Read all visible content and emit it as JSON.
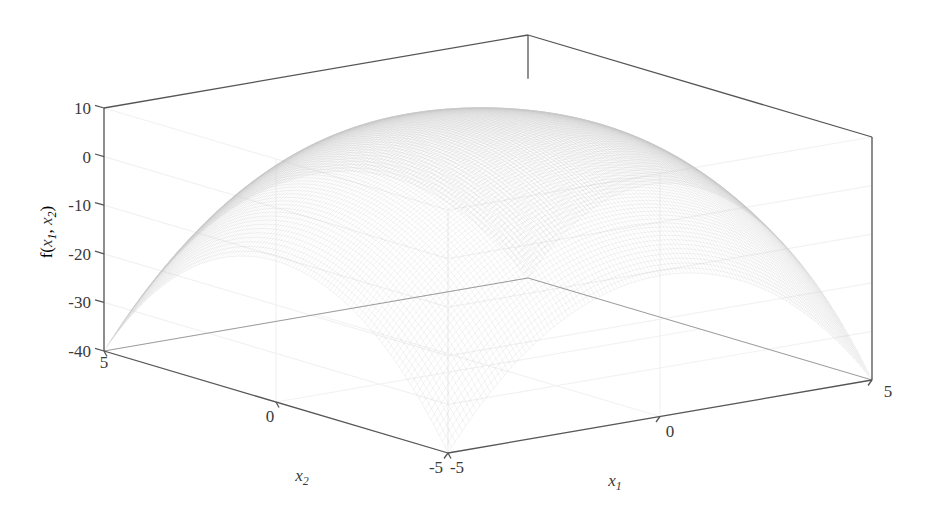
{
  "figure": {
    "type": "surface-plot-3d",
    "background_color": "#ffffff",
    "axis_line_color": "#555555",
    "grid_color": "#f2f2f2",
    "mesh_color": "#c8c8c8",
    "text_color": "#3a3a3a"
  },
  "chart_data": {
    "type": "surface",
    "title": "",
    "xlabel": "x_1",
    "ylabel": "x_2",
    "zlabel": "f(x_1, x_2)",
    "xlabel_display": "x",
    "xlabel_sub": "1",
    "ylabel_display": "x",
    "ylabel_sub": "2",
    "zlabel_prefix": "f(",
    "zlabel_x1": "x",
    "zlabel_x1_sub": "1",
    "zlabel_sep": ", ",
    "zlabel_x2": "x",
    "zlabel_x2_sub": "2",
    "zlabel_suffix": ")",
    "xlim": [
      -5,
      5
    ],
    "ylim": [
      -5,
      5
    ],
    "zlim": [
      -40,
      10
    ],
    "xticks": [
      -5,
      0,
      5
    ],
    "xtick_labels": [
      "-5",
      "0",
      "5"
    ],
    "yticks": [
      -5,
      0,
      5
    ],
    "ytick_labels": [
      "-5",
      "0",
      "5"
    ],
    "zticks": [
      -40,
      -30,
      -20,
      -10,
      0,
      10
    ],
    "ztick_labels": [
      "-40",
      "-30",
      "-20",
      "-10",
      "0",
      "10"
    ],
    "grid": true,
    "legend": false,
    "surface_style": "fine mesh wireframe, very light gray, no face shading",
    "peak_value": 10,
    "peak_x": 0,
    "peak_y": 0,
    "corner_value": -40,
    "view_azimuth_deg": -37.5,
    "view_elevation_deg": 30,
    "mesh_resolution": 120
  },
  "axes_box": {
    "origin_corner_px": [
      104,
      351
    ],
    "front_corner_px": [
      448,
      453
    ],
    "right_corner_px": [
      872,
      380
    ],
    "back_corner_px": [
      548,
      285
    ],
    "z_top_px": 108,
    "z_bottom_px": 351
  },
  "tick_texts": {
    "z": [
      "10",
      "0",
      "-10",
      "-20",
      "-30",
      "-40"
    ],
    "y_origin": "5",
    "y_mid": "0",
    "y_end": "-5",
    "x_start": "-5",
    "x_mid": "0",
    "x_end": "5"
  }
}
